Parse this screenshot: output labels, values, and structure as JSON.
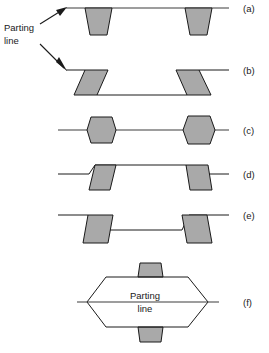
{
  "figure": {
    "background_color": "#ffffff",
    "part_fill_color": "#a9a9a9",
    "line_color": "#1a1a1a",
    "parting_line_color": "#3c3c3c"
  },
  "callout": {
    "label_line_1": "Parting",
    "label_line_2": "line",
    "arrows": [
      {
        "name": "arrow-to-row-a",
        "direction": "up-right",
        "target_row": "a"
      },
      {
        "name": "arrow-to-row-b",
        "direction": "down-right",
        "target_row": "b"
      }
    ]
  },
  "rows": [
    {
      "id": "a",
      "label": "(a)",
      "description": "Flat parting line with two downward draft-tapered cavities (trapezoids wider at top)",
      "parting_line_y": 8,
      "feature_direction": "down",
      "feature_shape": "trapezoid",
      "feature_count": 2
    },
    {
      "id": "b",
      "label": "(b)",
      "description": "Stepped parting line forming a recessed channel with slanted parallelogram side walls",
      "parting_line_y": 70,
      "recess_line_y": 95,
      "feature_direction": "down",
      "feature_shape": "parallelogram",
      "feature_count": 2
    },
    {
      "id": "c",
      "label": "(c)",
      "description": "Parting line through the center of two barrel/hexagonal bosses split equally between halves",
      "parting_line_y": 130,
      "feature_direction": "both",
      "feature_shape": "hexagon",
      "feature_count": 2
    },
    {
      "id": "d",
      "label": "(d)",
      "description": "Raised platform with two upward draft-tapered ribs above the parting line",
      "parting_line_y": 174,
      "raised_line_y": 165,
      "feature_direction": "up",
      "feature_shape": "trapezoid",
      "feature_count": 2
    },
    {
      "id": "e",
      "label": "(e)",
      "description": "Recessed pocket with two downward draft-tapered walls below the parting line",
      "parting_line_y": 215,
      "recess_line_y": 230,
      "feature_direction": "down",
      "feature_shape": "trapezoid",
      "feature_count": 2
    },
    {
      "id": "f",
      "label": "(f)",
      "description": "Hexagonal part with a horizontal parting line through its mid-plane and small bosses top and bottom",
      "parting_line_y": 302,
      "inner_label_line_1": "Parting",
      "inner_label_line_2": "line",
      "feature_direction": "both",
      "feature_shape": "hexagon-body",
      "feature_count": 2
    }
  ]
}
